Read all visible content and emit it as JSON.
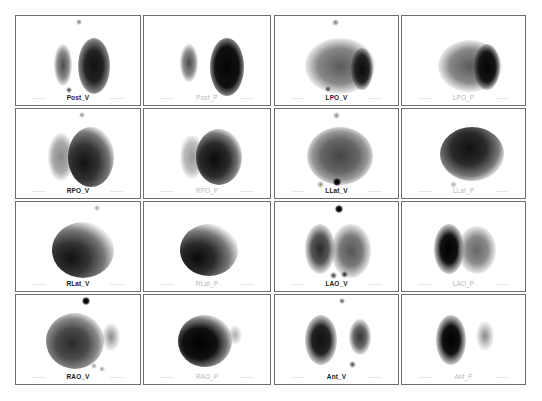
{
  "grid": {
    "columns": [
      15,
      143,
      274,
      401
    ],
    "rows": [
      15,
      108,
      201,
      294
    ],
    "panel_width": 126,
    "panel_height": 91
  },
  "panels": [
    {
      "label": "Post_V",
      "type": "V"
    },
    {
      "label": "Post_P",
      "type": "P"
    },
    {
      "label": "LPO_V",
      "type": "V"
    },
    {
      "label": "LPO_P",
      "type": "P"
    },
    {
      "label": "RPO_V",
      "type": "V"
    },
    {
      "label": "RPO_P",
      "type": "P"
    },
    {
      "label": "LLat_V",
      "type": "V"
    },
    {
      "label": "LLat_P",
      "type": "P"
    },
    {
      "label": "RLat_V",
      "type": "V"
    },
    {
      "label": "RLat_P",
      "type": "P"
    },
    {
      "label": "LAO_V",
      "type": "V"
    },
    {
      "label": "LAO_P",
      "type": "P"
    },
    {
      "label": "RAO_V",
      "type": "V"
    },
    {
      "label": "RAO_P",
      "type": "P"
    },
    {
      "label": "Ant_V",
      "type": "V"
    },
    {
      "label": "Ant_P",
      "type": "P"
    }
  ],
  "colors": {
    "border": "#6e6e6e",
    "label_v": "#1a1a1a",
    "label_p": "#b8b8b8",
    "uptake_dark": "#111111"
  }
}
